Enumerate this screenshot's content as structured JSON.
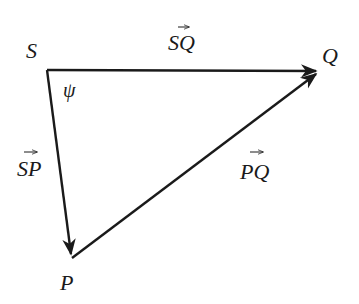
{
  "diagram": {
    "type": "vector-triangle",
    "vertices": [
      {
        "id": "S",
        "label": "S",
        "x": 47,
        "y": 70
      },
      {
        "id": "Q",
        "label": "Q",
        "x": 320,
        "y": 71
      },
      {
        "id": "P",
        "label": "P",
        "x": 72,
        "y": 258
      }
    ],
    "vectors": [
      {
        "id": "SQ",
        "label": "SQ",
        "from": "S",
        "to": "Q"
      },
      {
        "id": "SP",
        "label": "SP",
        "from": "S",
        "to": "P"
      },
      {
        "id": "PQ",
        "label": "PQ",
        "from": "P",
        "to": "Q"
      }
    ],
    "angle": {
      "vertex": "S",
      "label": "ψ"
    },
    "colors": {
      "stroke": "#1a1a1a",
      "background": "#ffffff"
    }
  }
}
